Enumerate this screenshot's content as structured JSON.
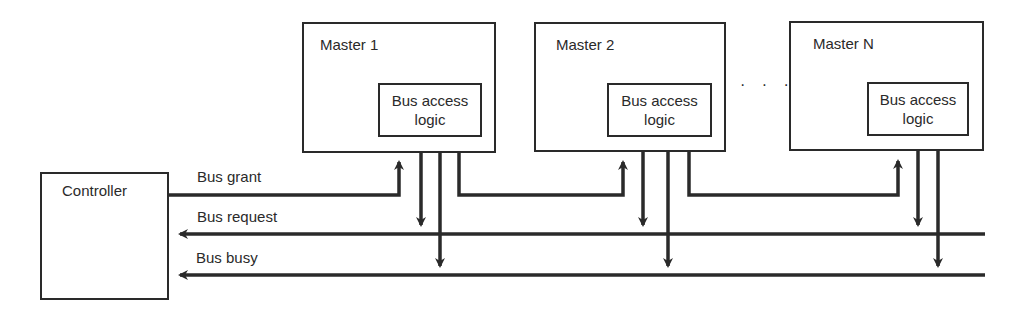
{
  "diagram": {
    "controller": {
      "label": "Controller"
    },
    "masters": [
      {
        "label": "Master 1",
        "logic_label_line1": "Bus access",
        "logic_label_line2": "logic"
      },
      {
        "label": "Master 2",
        "logic_label_line1": "Bus access",
        "logic_label_line2": "logic"
      },
      {
        "label": "Master N",
        "logic_label_line1": "Bus access",
        "logic_label_line2": "logic"
      }
    ],
    "ellipsis": "· · ·",
    "lines": {
      "grant": "Bus grant",
      "request": "Bus request",
      "busy": "Bus busy"
    },
    "colors": {
      "stroke": "#2a2a2a",
      "background": "#ffffff"
    }
  }
}
